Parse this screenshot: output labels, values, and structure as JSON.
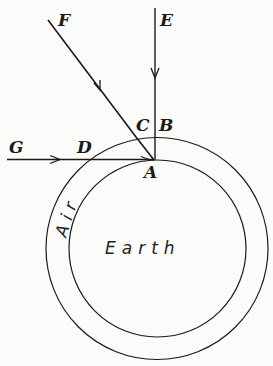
{
  "diagram": {
    "points": {
      "A": "A",
      "B": "B",
      "C": "C",
      "D": "D",
      "E": "E",
      "F": "F",
      "G": "G"
    },
    "regions": {
      "earth": "Earth",
      "air": "Air"
    },
    "colors": {
      "ink": "#1a1a1a",
      "paper": "#fbfbfa"
    }
  }
}
